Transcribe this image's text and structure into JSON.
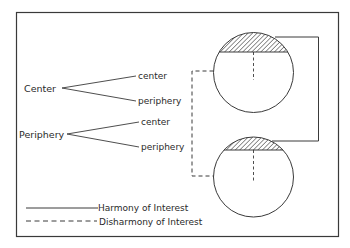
{
  "diagram": {
    "type": "center-periphery interest diagram",
    "tree": [
      {
        "label": "Center",
        "children": [
          {
            "label": "center"
          },
          {
            "label": "periphery"
          }
        ]
      },
      {
        "label": "Periphery",
        "children": [
          {
            "label": "center"
          },
          {
            "label": "periphery"
          }
        ]
      }
    ],
    "nations": [
      {
        "name": "top-nation",
        "hatched_cap": "center",
        "lower": "periphery"
      },
      {
        "name": "bottom-nation",
        "hatched_cap": "center",
        "lower": "periphery"
      }
    ],
    "connections": [
      {
        "from": "top-nation.center",
        "to": "bottom-nation.center",
        "style": "solid"
      },
      {
        "from": "top-nation.periphery",
        "to": "bottom-nation.periphery",
        "style": "dashed"
      }
    ],
    "legend": {
      "solid_label": "Harmony of Interest",
      "dashed_label": "Disharmony of Interest"
    },
    "colors": {
      "stroke": "#3a3a3a",
      "text": "#2a2a2a",
      "background": "#ffffff"
    }
  }
}
